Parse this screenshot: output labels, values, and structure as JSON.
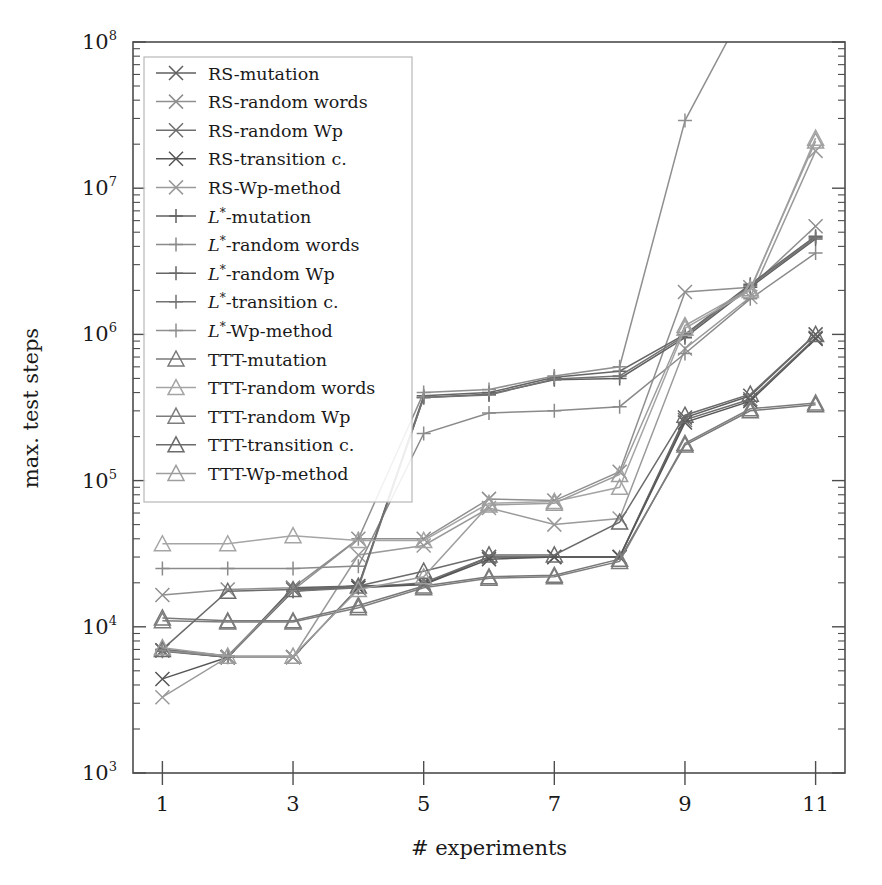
{
  "chart_data": {
    "type": "line",
    "title": "",
    "xlabel": "# experiments",
    "ylabel": "max. test steps",
    "yscale": "log",
    "ylim": [
      1000,
      100000000
    ],
    "xlim": [
      0.55,
      11.45
    ],
    "grid": false,
    "legend_position": "upper-left-inside",
    "x": [
      1,
      2,
      3,
      4,
      5,
      6,
      7,
      8,
      9,
      10,
      11
    ],
    "ytick_labels": [
      "10^3",
      "10^4",
      "10^5",
      "10^6",
      "10^7",
      "10^8"
    ],
    "ytick_values": [
      1000,
      10000,
      100000,
      1000000,
      10000000,
      100000000
    ],
    "xtick_labels": [
      "1",
      "3",
      "5",
      "7",
      "9",
      "11"
    ],
    "xtick_values": [
      1,
      3,
      5,
      7,
      9,
      11
    ],
    "series": [
      {
        "name": "RS-mutation",
        "marker": "x",
        "color": "#5f5f5f",
        "values": [
          6900,
          6200,
          18500,
          19000,
          19500,
          30000,
          30000,
          30000,
          270000,
          380000,
          1000000
        ]
      },
      {
        "name": "RS-random words",
        "marker": "x",
        "color": "#8f8f8f",
        "values": [
          16500,
          18000,
          18500,
          40000,
          40000,
          75000,
          73000,
          115000,
          1950000,
          2100000,
          5500000
        ]
      },
      {
        "name": "RS-random Wp",
        "marker": "x",
        "color": "#6e6e6e",
        "values": [
          6900,
          6200,
          18000,
          18500,
          20000,
          30000,
          30000,
          30000,
          260000,
          360000,
          950000
        ]
      },
      {
        "name": "RS-transition c.",
        "marker": "x",
        "color": "#565656",
        "values": [
          4400,
          6200,
          6200,
          18500,
          19500,
          29000,
          30000,
          30000,
          250000,
          350000,
          930000
        ]
      },
      {
        "name": "RS-Wp-method",
        "marker": "x",
        "color": "#9a9a9a",
        "values": [
          3300,
          6200,
          6200,
          31000,
          36000,
          65000,
          50000,
          55000,
          800000,
          1800000,
          18000000
        ]
      },
      {
        "name": "L*-mutation",
        "marker": "plus",
        "color": "#606060",
        "values": [
          7000,
          6300,
          18000,
          19000,
          370000,
          390000,
          490000,
          500000,
          950000,
          2100000,
          4500000
        ]
      },
      {
        "name": "L*-random words",
        "marker": "plus",
        "color": "#8a8a8a",
        "values": [
          25000,
          25000,
          25000,
          26000,
          210000,
          290000,
          300000,
          320000,
          740000,
          1750000,
          3600000
        ]
      },
      {
        "name": "L*-random Wp",
        "marker": "plus",
        "color": "#666666",
        "values": [
          7000,
          6300,
          17500,
          19000,
          380000,
          400000,
          510000,
          560000,
          1000000,
          2200000,
          4700000
        ]
      },
      {
        "name": "L*-transition c.",
        "marker": "plus",
        "color": "#737373",
        "values": [
          6800,
          6200,
          17500,
          18500,
          370000,
          385000,
          495000,
          520000,
          980000,
          2150000,
          4600000
        ]
      },
      {
        "name": "L*-Wp-method",
        "marker": "plus",
        "color": "#8f8f8f",
        "values": [
          6900,
          6300,
          17800,
          40000,
          400000,
          420000,
          520000,
          600000,
          29000000,
          200000000,
          900000000
        ]
      },
      {
        "name": "TTT-mutation",
        "marker": "triangle",
        "color": "#787878",
        "values": [
          11500,
          11000,
          11000,
          14000,
          19000,
          22000,
          22500,
          29000,
          175000,
          300000,
          330000
        ]
      },
      {
        "name": "TTT-random words",
        "marker": "triangle",
        "color": "#a5a5a5",
        "values": [
          37000,
          37000,
          42000,
          39000,
          39000,
          70000,
          72000,
          90000,
          1100000,
          2000000,
          22000000
        ]
      },
      {
        "name": "TTT-random Wp",
        "marker": "triangle",
        "color": "#7d7d7d",
        "values": [
          11000,
          10800,
          10800,
          13500,
          18500,
          21500,
          22000,
          28000,
          180000,
          310000,
          340000
        ]
      },
      {
        "name": "TTT-transition c.",
        "marker": "triangle",
        "color": "#6b6b6b",
        "values": [
          7000,
          17500,
          18000,
          19000,
          24000,
          31000,
          31000,
          52000,
          280000,
          390000,
          1000000
        ]
      },
      {
        "name": "TTT-Wp-method",
        "marker": "triangle",
        "color": "#9e9e9e",
        "values": [
          7200,
          6300,
          6300,
          18000,
          22000,
          68000,
          70000,
          110000,
          1150000,
          2050000,
          21000000
        ]
      }
    ]
  },
  "legend": {
    "items": [
      {
        "label": "RS-mutation",
        "marker": "x"
      },
      {
        "label": "RS-random words",
        "marker": "x"
      },
      {
        "label": "RS-random Wp",
        "marker": "x"
      },
      {
        "label": "RS-transition c.",
        "marker": "x"
      },
      {
        "label": "RS-Wp-method",
        "marker": "x"
      },
      {
        "label": "L*-mutation",
        "marker": "plus",
        "italic_prefix": "L",
        "sup": "*",
        "rest": "-mutation"
      },
      {
        "label": "L*-random words",
        "marker": "plus",
        "italic_prefix": "L",
        "sup": "*",
        "rest": "-random words"
      },
      {
        "label": "L*-random Wp",
        "marker": "plus",
        "italic_prefix": "L",
        "sup": "*",
        "rest": "-random Wp"
      },
      {
        "label": "L*-transition c.",
        "marker": "plus",
        "italic_prefix": "L",
        "sup": "*",
        "rest": "-transition c."
      },
      {
        "label": "L*-Wp-method",
        "marker": "plus",
        "italic_prefix": "L",
        "sup": "*",
        "rest": "-Wp-method"
      },
      {
        "label": "TTT-mutation",
        "marker": "triangle"
      },
      {
        "label": "TTT-random words",
        "marker": "triangle"
      },
      {
        "label": "TTT-random Wp",
        "marker": "triangle"
      },
      {
        "label": "TTT-transition c.",
        "marker": "triangle"
      },
      {
        "label": "TTT-Wp-method",
        "marker": "triangle"
      }
    ]
  },
  "axes": {
    "y_title": "max. test steps",
    "x_title": "# experiments",
    "y_ticks": [
      {
        "base": "10",
        "exp": "8"
      },
      {
        "base": "10",
        "exp": "7"
      },
      {
        "base": "10",
        "exp": "6"
      },
      {
        "base": "10",
        "exp": "5"
      },
      {
        "base": "10",
        "exp": "4"
      },
      {
        "base": "10",
        "exp": "3"
      }
    ],
    "x_ticks": [
      "1",
      "3",
      "5",
      "7",
      "9",
      "11"
    ]
  },
  "colors": {
    "axis": "#4d4d4d",
    "text": "#1a1a1a",
    "legend_border": "#b8b8b8",
    "background": "#ffffff"
  }
}
